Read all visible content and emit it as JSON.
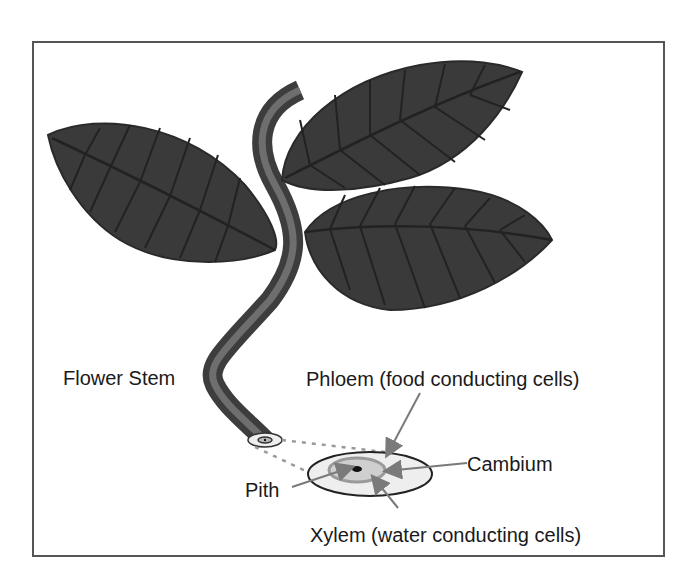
{
  "diagram": {
    "labels": {
      "flower_stem": "Flower Stem",
      "phloem": "Phloem (food conducting cells)",
      "cambium": "Cambium",
      "pith": "Pith",
      "xylem": "Xylem (water conducting cells)"
    },
    "colors": {
      "leaf_fill": "#3a3a3a",
      "leaf_vein": "#222222",
      "stem_outer": "#3d3d3d",
      "stem_inner": "#6e6e6e",
      "border": "#555555",
      "arrow": "#7a7a7a",
      "cross_section_outer": "#eeeeee",
      "cross_section_ring": "#a0a0a0",
      "cross_section_inner": "#cfcfcf"
    }
  }
}
